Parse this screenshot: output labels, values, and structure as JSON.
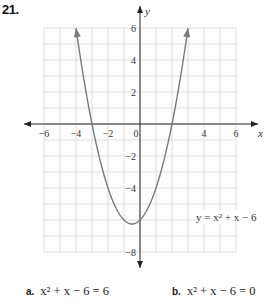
{
  "problem": {
    "number": "21."
  },
  "chart_data": {
    "type": "line",
    "title": "",
    "function": "y = x^2 + x - 6",
    "xlabel": "x",
    "ylabel": "y",
    "xlim": [
      -6,
      6
    ],
    "ylim": [
      -8,
      6
    ],
    "grid": true,
    "x_ticks": [
      -6,
      -4,
      -2,
      0,
      4,
      6
    ],
    "x_tick_labels": [
      "−6",
      "−4",
      "−2",
      "0",
      "4",
      "6"
    ],
    "y_ticks": [
      6,
      4,
      2,
      -2,
      -4,
      -8
    ],
    "y_tick_labels": [
      "6",
      "4",
      "2",
      "−2",
      "−4",
      "−8"
    ],
    "series": [
      {
        "name": "y = x² + x − 6",
        "coefficients": {
          "a": 1,
          "b": 1,
          "c": -6
        },
        "x_range": [
          -4,
          3
        ],
        "arrows_at_ends": true
      }
    ],
    "annotations": [
      {
        "text": "y = x² + x − 6",
        "x": 3.5,
        "y": -6
      }
    ]
  },
  "parts": [
    {
      "letter": "a.",
      "equation": "x² + x − 6 = 6"
    },
    {
      "letter": "b.",
      "equation": "x² + x − 6 = 0"
    }
  ]
}
